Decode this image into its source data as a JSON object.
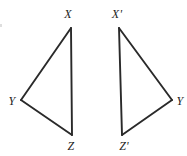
{
  "figure": {
    "type": "geometry-diagram",
    "background_color": "#ffffff",
    "stroke_color": "#2a2a2a",
    "label_color": "#1d1d1d",
    "stroke_width": 2,
    "canvas": {
      "width": 187,
      "height": 156
    },
    "shapes": [
      {
        "name": "triangle-xyz",
        "vertices": [
          {
            "id": "X",
            "label": "X",
            "x": 71,
            "y": 28,
            "label_x": 68,
            "label_y": 14
          },
          {
            "id": "Y",
            "label": "Y",
            "x": 21,
            "y": 100,
            "label_x": 12,
            "label_y": 101
          },
          {
            "id": "Z",
            "label": "Z",
            "x": 72,
            "y": 135,
            "label_x": 71,
            "label_y": 146
          }
        ],
        "edges": [
          {
            "name": "edge-XY",
            "from": "X",
            "to": "Y"
          },
          {
            "name": "edge-YZ",
            "from": "Y",
            "to": "Z"
          },
          {
            "name": "edge-ZX",
            "from": "Z",
            "to": "X"
          }
        ]
      },
      {
        "name": "triangle-x-prime-y-z-prime",
        "vertices": [
          {
            "id": "Xp",
            "label": "X'",
            "x": 119,
            "y": 28,
            "label_x": 117,
            "label_y": 14
          },
          {
            "id": "Y2",
            "label": "Y",
            "x": 172,
            "y": 100,
            "label_x": 180,
            "label_y": 101
          },
          {
            "id": "Zp",
            "label": "Z'",
            "x": 122,
            "y": 135,
            "label_x": 124,
            "label_y": 146
          }
        ],
        "edges": [
          {
            "name": "edge-XpY",
            "from": "Xp",
            "to": "Y2"
          },
          {
            "name": "edge-YZp",
            "from": "Y2",
            "to": "Zp"
          },
          {
            "name": "edge-ZpXp",
            "from": "Zp",
            "to": "Xp"
          }
        ]
      }
    ],
    "labels": [
      {
        "name": "label-x",
        "text": "X",
        "x": 68,
        "y": 14
      },
      {
        "name": "label-y-left",
        "text": "Y",
        "x": 12,
        "y": 101
      },
      {
        "name": "label-z",
        "text": "Z",
        "x": 71,
        "y": 146
      },
      {
        "name": "label-x-prime",
        "text": "X'",
        "x": 117,
        "y": 14
      },
      {
        "name": "label-y-right",
        "text": "Y",
        "x": 180,
        "y": 101
      },
      {
        "name": "label-z-prime",
        "text": "Z'",
        "x": 124,
        "y": 146
      }
    ]
  }
}
